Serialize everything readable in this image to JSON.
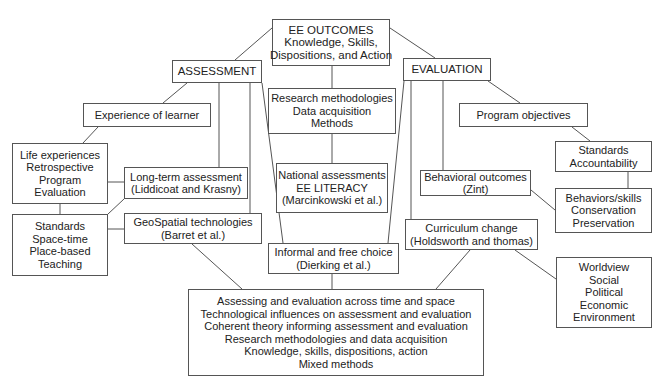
{
  "diagram": {
    "outcomes": {
      "lines": [
        "EE OUTCOMES",
        "Knowledge, Skills,",
        "Dispositions, and Action"
      ]
    },
    "assessment": {
      "lines": [
        "ASSESSMENT"
      ]
    },
    "evaluation": {
      "lines": [
        "EVALUATION"
      ]
    },
    "experience": {
      "lines": [
        "Experience of learner"
      ]
    },
    "program_objectives": {
      "lines": [
        "Program objectives"
      ]
    },
    "research": {
      "lines": [
        "Research methodologies",
        "Data acquisition",
        "Methods"
      ]
    },
    "life_experiences": {
      "lines": [
        "Life experiences",
        "Retrospective",
        "Program",
        "Evaluation"
      ]
    },
    "long_term": {
      "lines": [
        "Long-term assessment",
        "(Liddicoat and Krasny)"
      ]
    },
    "standards_space": {
      "lines": [
        "Standards",
        "Space-time",
        "Place-based",
        "Teaching"
      ]
    },
    "geospatial": {
      "lines": [
        "GeoSpatial technologies",
        "(Barret et al.)"
      ]
    },
    "national": {
      "lines": [
        "National assessments",
        "EE LITERACY",
        "(Marcinkowski et al.)"
      ]
    },
    "behavioral": {
      "lines": [
        "Behavioral outcomes",
        "(Zint)"
      ]
    },
    "standards_accountability": {
      "lines": [
        "Standards",
        "Accountability"
      ]
    },
    "behaviors_skills": {
      "lines": [
        "Behaviors/skills",
        "Conservation",
        "Preservation"
      ]
    },
    "curriculum": {
      "lines": [
        "Curriculum change",
        "(Holdsworth and thomas)"
      ]
    },
    "informal": {
      "lines": [
        "Informal and free choice",
        "(Dierking et al.)"
      ]
    },
    "summary": {
      "lines": [
        "Assessing and evaluation across time and space",
        "Technological influences on assessment and evaluation",
        "Coherent theory informing assessment and evaluation",
        "Research methodologies and data acquisition",
        "Knowledge, skills, dispositions, action",
        "Mixed methods"
      ]
    },
    "worldview": {
      "lines": [
        "Worldview",
        "Social",
        "Political",
        "Economic",
        "Environment"
      ]
    }
  }
}
